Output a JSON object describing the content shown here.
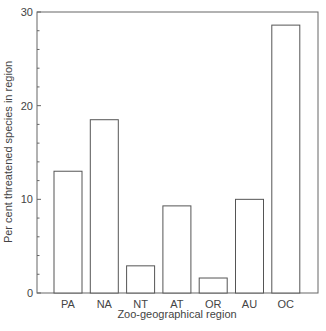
{
  "chart_data": {
    "type": "bar",
    "title": "",
    "xlabel": "Zoo-geographical region",
    "ylabel": "Per cent threatened species in region",
    "categories": [
      "PA",
      "NA",
      "NT",
      "AT",
      "OR",
      "AU",
      "OC"
    ],
    "values": [
      13.0,
      18.5,
      2.9,
      9.3,
      1.6,
      10.0,
      28.6
    ],
    "ylim": [
      0,
      30
    ],
    "yticks_major": [
      0,
      10,
      20,
      30
    ],
    "yticks_minor_step": 2,
    "grid": false,
    "legend": null,
    "bar_fill": "#ffffff",
    "bar_stroke": "#555555"
  }
}
